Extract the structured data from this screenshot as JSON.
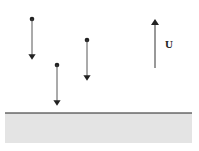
{
  "diagram": {
    "velocity_label": "U",
    "colors": {
      "ink": "#222222",
      "ground": "#e4e4e4"
    },
    "particles": [
      {
        "x": 32,
        "y": 19,
        "arrow_end": 60
      },
      {
        "x": 57,
        "y": 65,
        "arrow_end": 106
      },
      {
        "x": 87,
        "y": 40,
        "arrow_end": 81
      }
    ],
    "velocity_arrow": {
      "x": 155,
      "y_top": 18,
      "y_bottom": 68
    },
    "ground": {
      "y": 113,
      "x1": 5,
      "x2": 192,
      "bottom": 143
    }
  }
}
